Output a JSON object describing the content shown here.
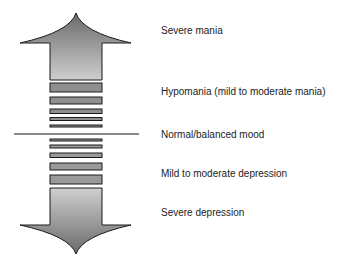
{
  "diagram": {
    "type": "mood-spectrum",
    "arrows": {
      "up": {
        "meaning": "toward mania",
        "fill_top": "#6e6e6e",
        "fill_bottom": "#c8c8c8"
      },
      "down": {
        "meaning": "toward depression",
        "fill_top": "#c8c8c8",
        "fill_bottom": "#6e6e6e"
      }
    },
    "divider_label": "Normal/balanced mood",
    "levels": [
      {
        "id": "severe-mania",
        "label": "Severe mania",
        "y": 30
      },
      {
        "id": "hypomania",
        "label": "Hypomania (mild to moderate mania)",
        "y": 91
      },
      {
        "id": "normal",
        "label": "Normal/balanced mood",
        "y": 134
      },
      {
        "id": "mild-depression",
        "label": "Mild to moderate depression",
        "y": 173
      },
      {
        "id": "severe-depression",
        "label": "Severe depression",
        "y": 212
      }
    ],
    "colors": {
      "outline": "#1a1a1a",
      "bar_fill": "#9a9a9a",
      "text": "#222222",
      "background": "#ffffff"
    }
  }
}
